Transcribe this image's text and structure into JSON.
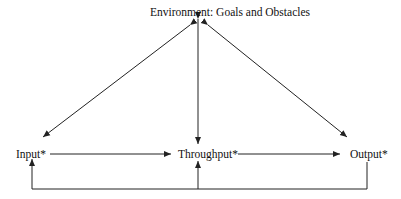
{
  "diagram": {
    "nodes": {
      "environment": "Environment: Goals and Obstacles",
      "input": "Input*",
      "throughput": "Throughput*",
      "output": "Output*"
    },
    "edges": [
      {
        "from": "environment",
        "to": "input",
        "bidirectional": true
      },
      {
        "from": "environment",
        "to": "throughput",
        "bidirectional": true
      },
      {
        "from": "environment",
        "to": "output",
        "bidirectional": true
      },
      {
        "from": "input",
        "to": "throughput",
        "bidirectional": false
      },
      {
        "from": "throughput",
        "to": "output",
        "bidirectional": false
      },
      {
        "from": "output",
        "to": "input",
        "bidirectional": false,
        "route": "feedback loop below"
      },
      {
        "from": "output",
        "to": "throughput",
        "bidirectional": false,
        "route": "feedback loop below"
      }
    ],
    "line_color": "#222222"
  }
}
